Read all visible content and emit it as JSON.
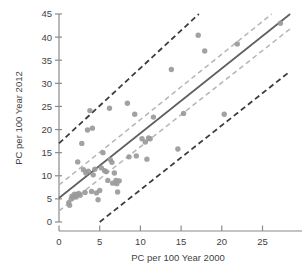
{
  "chart_data": {
    "type": "scatter",
    "title": "",
    "xlabel": "PC per 100 Year 2000",
    "ylabel": "PC per 100 Year 2012",
    "xlim": [
      0,
      28.5
    ],
    "ylim": [
      0,
      45
    ],
    "xticks": [
      0,
      5,
      10,
      15,
      20,
      25
    ],
    "yticks": [
      0,
      5,
      10,
      15,
      20,
      25,
      30,
      35,
      40,
      45
    ],
    "xtick_labels": [
      "0",
      "5",
      "10",
      "15",
      "20",
      "25"
    ],
    "ytick_labels": [
      "0",
      "5",
      "10",
      "15",
      "20",
      "25",
      "30",
      "35",
      "40",
      "45"
    ],
    "grid": false,
    "legend": null,
    "point_color": "#9a9a9a",
    "fit_line_color": "#5f5f5f",
    "confidence_band_color": "#b5b5b5",
    "prediction_band_color": "#3c3c3c",
    "points": [
      [
        1.2,
        4.2
      ],
      [
        1.3,
        3.6
      ],
      [
        1.5,
        5.0
      ],
      [
        1.6,
        5.6
      ],
      [
        1.8,
        5.5
      ],
      [
        1.9,
        6.0
      ],
      [
        2.1,
        5.4
      ],
      [
        2.2,
        5.9
      ],
      [
        2.3,
        13.0
      ],
      [
        2.4,
        6.2
      ],
      [
        2.6,
        5.8
      ],
      [
        2.8,
        17.0
      ],
      [
        3.0,
        11.3
      ],
      [
        3.2,
        6.4
      ],
      [
        3.3,
        10.6
      ],
      [
        3.5,
        19.9
      ],
      [
        3.6,
        11.0
      ],
      [
        3.8,
        24.1
      ],
      [
        4.0,
        6.6
      ],
      [
        4.1,
        20.3
      ],
      [
        4.2,
        10.2
      ],
      [
        4.4,
        11.4
      ],
      [
        4.6,
        6.3
      ],
      [
        4.8,
        4.8
      ],
      [
        5.0,
        6.8
      ],
      [
        5.2,
        11.7
      ],
      [
        5.4,
        15.0
      ],
      [
        5.6,
        11.1
      ],
      [
        5.8,
        10.9
      ],
      [
        6.0,
        9.0
      ],
      [
        6.2,
        24.6
      ],
      [
        6.3,
        13.5
      ],
      [
        6.5,
        12.9
      ],
      [
        6.6,
        8.4
      ],
      [
        6.8,
        10.6
      ],
      [
        7.0,
        9.0
      ],
      [
        7.1,
        8.3
      ],
      [
        7.2,
        6.5
      ],
      [
        7.4,
        8.9
      ],
      [
        8.4,
        25.7
      ],
      [
        8.6,
        14.1
      ],
      [
        9.3,
        23.3
      ],
      [
        9.5,
        14.3
      ],
      [
        10.2,
        18.0
      ],
      [
        10.6,
        17.3
      ],
      [
        10.8,
        13.6
      ],
      [
        11.0,
        18.2
      ],
      [
        11.2,
        18.0
      ],
      [
        11.6,
        22.7
      ],
      [
        13.8,
        33.0
      ],
      [
        14.6,
        15.8
      ],
      [
        15.3,
        23.5
      ],
      [
        17.1,
        40.4
      ],
      [
        17.9,
        37.0
      ],
      [
        20.3,
        23.3
      ],
      [
        21.9,
        38.5
      ],
      [
        27.2,
        43.0
      ]
    ],
    "fit_line": {
      "from": [
        0,
        5.2
      ],
      "to": [
        28.4,
        45.0
      ],
      "style": "solid"
    },
    "confidence_band_upper": {
      "from": [
        0,
        8.0
      ],
      "to": [
        28.4,
        48.2
      ],
      "style": "dashed"
    },
    "confidence_band_lower": {
      "from": [
        0,
        2.4
      ],
      "to": [
        28.4,
        41.8
      ],
      "style": "dashed"
    },
    "prediction_band_upper": {
      "from": [
        0,
        17.0
      ],
      "to": [
        17.8,
        46.0
      ],
      "style": "dashed"
    },
    "prediction_band_lower": {
      "from": [
        5.0,
        0.0
      ],
      "to": [
        28.4,
        32.6
      ],
      "style": "dashed"
    }
  }
}
